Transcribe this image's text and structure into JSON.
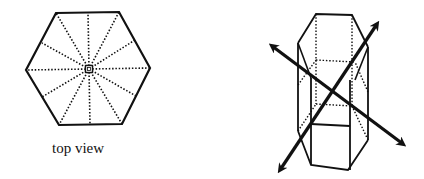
{
  "figure": {
    "left_panel": {
      "caption": "top view",
      "shape": "hexagon",
      "center": [
        89,
        69
      ],
      "vertices": [
        [
          56,
          13
        ],
        [
          119,
          12
        ],
        [
          150,
          68
        ],
        [
          122,
          124
        ],
        [
          59,
          125
        ],
        [
          26,
          70
        ]
      ],
      "radial_lines": 12
    },
    "right_panel": {
      "shape": "hexagonal-prism",
      "arrows": [
        {
          "from": [
            270,
            45
          ],
          "to": [
            405,
            145
          ]
        },
        {
          "from": [
            278,
            172
          ],
          "to": [
            378,
            22
          ]
        }
      ]
    },
    "colors": {
      "stroke": "#111111",
      "background": "#ffffff"
    }
  }
}
